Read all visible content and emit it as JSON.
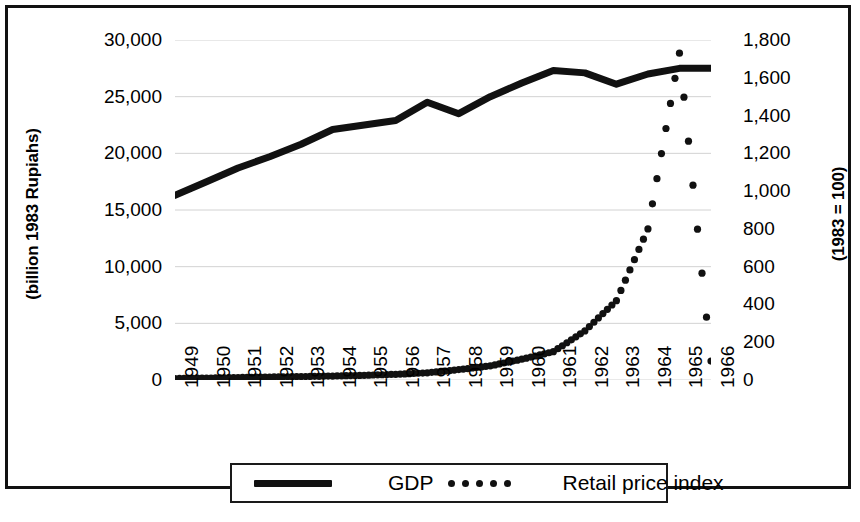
{
  "chart_data": {
    "type": "line",
    "title": "",
    "xlabel": "",
    "categories": [
      "1949",
      "1950",
      "1951",
      "1952",
      "1953",
      "1954",
      "1955",
      "1956",
      "1957",
      "1958",
      "1959",
      "1960",
      "1961",
      "1962",
      "1963",
      "1964",
      "1965",
      "1966"
    ],
    "grid": true,
    "legend_position": "bottom",
    "axes": {
      "left": {
        "label": "(billion 1983 Rupiahs)",
        "min": 0,
        "max": 30000,
        "step": 5000,
        "ticks": [
          "0",
          "5,000",
          "10,000",
          "15,000",
          "20,000",
          "25,000",
          "30,000"
        ]
      },
      "right": {
        "label": "(1983 = 100)",
        "min": 0,
        "max": 1800,
        "step": 200,
        "ticks": [
          "0",
          "200",
          "400",
          "600",
          "800",
          "1,000",
          "1,200",
          "1,400",
          "1,600",
          "1,800"
        ]
      }
    },
    "series": [
      {
        "name": "GDP",
        "axis": "left",
        "style": "solid",
        "color": "#111111",
        "values": [
          16300,
          17500,
          18700,
          19700,
          20800,
          22100,
          22500,
          22900,
          24500,
          23500,
          25000,
          26200,
          27300,
          27100,
          26100,
          27000,
          27500,
          27500
        ]
      },
      {
        "name": "Retail price index",
        "axis": "right",
        "style": "dotted",
        "color": "#111111",
        "values": [
          8,
          10,
          13,
          16,
          18,
          21,
          25,
          30,
          38,
          55,
          75,
          110,
          150,
          260,
          420,
          800,
          1730,
          100
        ]
      }
    ]
  },
  "legend": {
    "items": [
      {
        "label": "GDP",
        "marker": "solid-line"
      },
      {
        "label": "Retail price index",
        "marker": "dotted-line"
      }
    ]
  }
}
